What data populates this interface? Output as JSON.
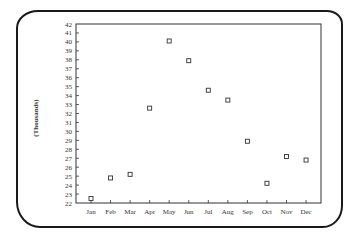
{
  "chart_data": {
    "type": "scatter",
    "title": "",
    "xlabel": "",
    "ylabel": "(Thousands)",
    "categories": [
      "Jan",
      "Feb",
      "Mar",
      "Apr",
      "May",
      "Jun",
      "Jul",
      "Aug",
      "Sep",
      "Oct",
      "Nov",
      "Dec"
    ],
    "values": [
      22.5,
      24.8,
      25.2,
      32.6,
      40.1,
      37.9,
      34.6,
      33.5,
      28.9,
      24.2,
      27.2,
      26.8
    ],
    "ylim": [
      22,
      42
    ],
    "yticks": [
      22,
      23,
      24,
      25,
      26,
      27,
      28,
      29,
      30,
      31,
      32,
      33,
      34,
      35,
      36,
      37,
      38,
      39,
      40,
      41,
      42
    ],
    "marker": "hollow-square",
    "grid": false,
    "legend": null
  }
}
